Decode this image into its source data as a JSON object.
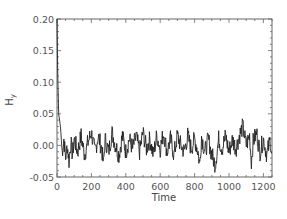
{
  "chart_data": {
    "type": "line",
    "title": "",
    "xlabel": "Time",
    "ylabel": "H_y",
    "xlim": [
      0,
      1250
    ],
    "ylim": [
      -0.05,
      0.2
    ],
    "x_ticks": [
      0,
      200,
      400,
      600,
      800,
      1000,
      1200
    ],
    "x_tick_labels": [
      "0",
      "200",
      "400",
      "600",
      "800",
      "1000",
      "1200"
    ],
    "y_ticks": [
      -0.05,
      0.0,
      0.05,
      0.1,
      0.15,
      0.2
    ],
    "y_tick_labels": [
      "-0.05",
      "0.00",
      "0.05",
      "0.10",
      "0.15",
      "0.20"
    ],
    "grid": false,
    "legend": null,
    "series": [
      {
        "name": "H_y",
        "color": "#222222",
        "description": "Starts near 0.20 at t=0, drops rapidly to ~0.04 by t~20, then fluctuates noisily around 0.00 with amplitude ~±0.025 for the rest of the run (to t~1250). Occasional dips to ~-0.03 near t~270, 830, 920, 1130; peaks ~0.03 near t~1080.",
        "x": [
          0,
          5,
          10,
          15,
          20,
          25,
          30,
          40,
          50,
          60,
          70,
          80,
          90,
          100,
          120,
          140,
          160,
          180,
          200,
          220,
          240,
          260,
          270,
          280,
          300,
          320,
          340,
          360,
          380,
          400,
          420,
          440,
          460,
          480,
          500,
          520,
          540,
          560,
          580,
          600,
          620,
          640,
          660,
          680,
          700,
          720,
          740,
          760,
          780,
          800,
          820,
          830,
          840,
          860,
          880,
          900,
          920,
          940,
          960,
          980,
          1000,
          1020,
          1040,
          1060,
          1080,
          1100,
          1120,
          1130,
          1140,
          1160,
          1180,
          1200,
          1220,
          1240,
          1250
        ],
        "y": [
          0.2,
          0.1,
          0.05,
          0.04,
          0.03,
          0.01,
          -0.01,
          0.01,
          -0.02,
          0.0,
          -0.025,
          0.005,
          -0.015,
          0.01,
          -0.01,
          0.015,
          -0.015,
          0.005,
          0.02,
          -0.01,
          0.015,
          -0.005,
          -0.03,
          0.01,
          -0.01,
          0.02,
          0.0,
          -0.015,
          0.015,
          -0.01,
          0.01,
          -0.005,
          0.015,
          -0.01,
          0.02,
          -0.005,
          0.01,
          -0.015,
          0.015,
          -0.005,
          0.02,
          -0.01,
          0.01,
          -0.015,
          0.015,
          0.0,
          -0.01,
          0.015,
          -0.005,
          0.01,
          -0.01,
          -0.03,
          0.015,
          -0.01,
          0.01,
          -0.015,
          -0.03,
          0.01,
          -0.005,
          0.015,
          -0.01,
          0.01,
          -0.005,
          0.015,
          0.03,
          0.0,
          0.015,
          -0.025,
          0.005,
          0.02,
          -0.01,
          0.01,
          -0.015,
          0.01,
          -0.02
        ]
      }
    ]
  }
}
